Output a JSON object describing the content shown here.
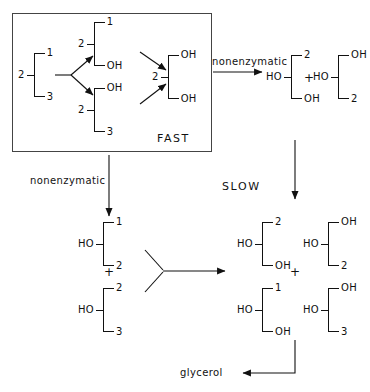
{
  "diagram": {
    "fast_label": "FAST",
    "slow_label": "SLOW",
    "glycerol_label": "glycerol",
    "nonenzymatic_top": "nonenzymatic",
    "nonenzymatic_left": "nonenzymatic"
  },
  "molecules": {
    "substrate": {
      "lead": "2",
      "top": "1",
      "bottom": "3"
    },
    "fast_upper": {
      "lead": "2",
      "top": "1",
      "bottom": "OH"
    },
    "fast_lower": {
      "lead": "2",
      "top": "OH",
      "bottom": "3"
    },
    "fast_product": {
      "lead": "2",
      "top": "OH",
      "bottom": "OH"
    },
    "topright_a": {
      "lead": "HO",
      "top": "2",
      "bottom": "OH"
    },
    "topright_b": {
      "lead": "HO",
      "top": "OH",
      "bottom": "2"
    },
    "left_a": {
      "lead": "HO",
      "top": "1",
      "bottom": "2"
    },
    "left_b": {
      "lead": "HO",
      "top": "2",
      "bottom": "3"
    },
    "slow_a": {
      "lead": "HO",
      "top": "2",
      "bottom": "OH"
    },
    "slow_b": {
      "lead": "HO",
      "top": "OH",
      "bottom": "2"
    },
    "slow_c": {
      "lead": "HO",
      "top": "1",
      "bottom": "OH"
    },
    "slow_d": {
      "lead": "HO",
      "top": "OH",
      "bottom": "3"
    }
  },
  "operators": {
    "plus_topright": "+",
    "plus_left": "+",
    "plus_slow_upper": "+",
    "plus_slow_lower": "+"
  },
  "colors": {
    "ink": "#111111",
    "frame": "#444444",
    "background": "#ffffff"
  }
}
